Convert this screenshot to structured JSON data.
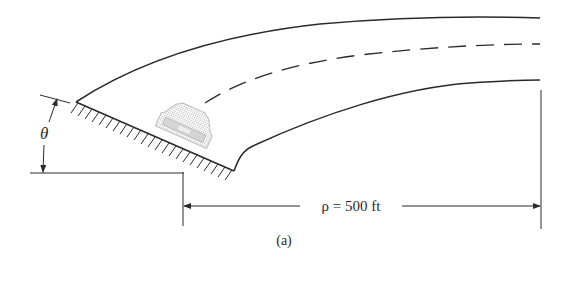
{
  "figure": {
    "caption": "(a)",
    "angle_label": "θ",
    "radius_label": "ρ = 500 ft",
    "colors": {
      "line": "#2a2a2a",
      "car": "#b8b8b8",
      "background": "#ffffff"
    },
    "elements": [
      "banked-road-curve",
      "road-centerline-dashed",
      "embankment-hatching",
      "car",
      "angle-dimension",
      "radius-dimension"
    ]
  }
}
